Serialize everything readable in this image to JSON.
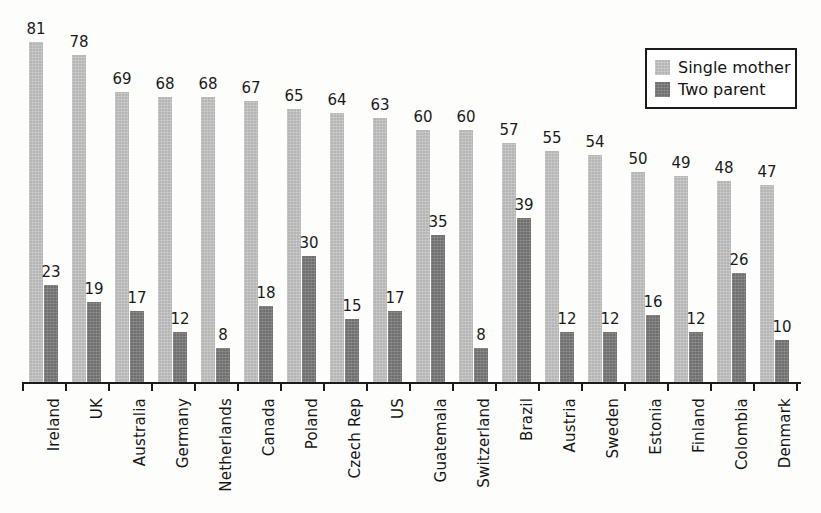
{
  "chart_data": {
    "type": "bar",
    "title": "",
    "subtitle": "",
    "xlabel": "",
    "ylabel": "",
    "ylim": [
      0,
      85
    ],
    "grid": false,
    "legend_position": "top-right",
    "orientation": "vertical",
    "grouping": "grouped",
    "categories": [
      "Ireland",
      "UK",
      "Australia",
      "Germany",
      "Netherlands",
      "Canada",
      "Poland",
      "Czech Rep",
      "US",
      "Guatemala",
      "Switzerland",
      "Brazil",
      "Austria",
      "Sweden",
      "Estonia",
      "Finland",
      "Colombia",
      "Denmark"
    ],
    "series": [
      {
        "name": "Single mother",
        "color": "#b5b5b5",
        "values": [
          81,
          78,
          69,
          68,
          68,
          67,
          65,
          64,
          63,
          60,
          60,
          57,
          55,
          54,
          50,
          49,
          48,
          47
        ]
      },
      {
        "name": "Two parent",
        "color": "#6f6f6f",
        "values": [
          23,
          19,
          17,
          12,
          8,
          18,
          30,
          15,
          17,
          35,
          8,
          39,
          12,
          12,
          16,
          12,
          26,
          10
        ]
      }
    ]
  },
  "legend": {
    "entries": [
      {
        "label": "Single mother",
        "swatch": "single-mother-swatch"
      },
      {
        "label": "Two parent",
        "swatch": "two-parent-swatch"
      }
    ]
  },
  "colors": {
    "single_mother": "#b5b5b5",
    "two_parent": "#6f6f6f",
    "axis": "#1b1b1b",
    "text": "#161616",
    "background": "#fdfdfc"
  }
}
